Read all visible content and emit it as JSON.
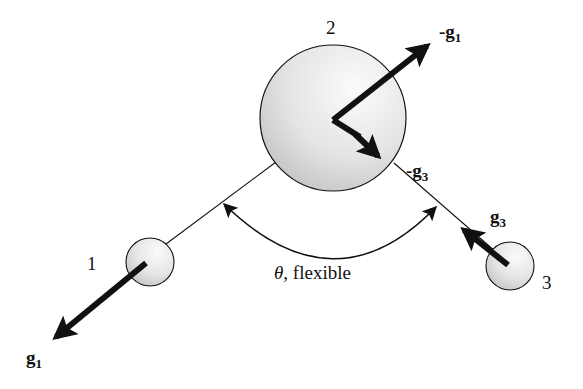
{
  "diagram": {
    "labels": {
      "bead1": "1",
      "bead2": "2",
      "bead3": "3",
      "angle_symbol": "θ",
      "angle_text": ", flexible",
      "vector_g1": "g",
      "vector_g1_sub": "1",
      "vector_neg_g1": "-g",
      "vector_neg_g1_sub": "1",
      "vector_g3": "g",
      "vector_g3_sub": "3",
      "vector_neg_g3": "-g",
      "vector_neg_g3_sub": "3"
    },
    "colors": {
      "stroke": "#111111",
      "bead_light": "#f7f7f7",
      "bead_dark": "#c9c9c9"
    }
  }
}
